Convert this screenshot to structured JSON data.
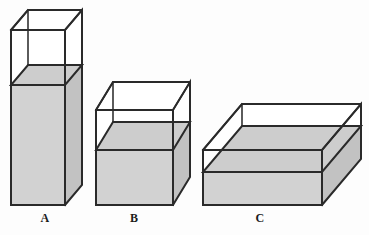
{
  "figure": {
    "background_color": "#fdfdfd",
    "edge_color": "#2a2a2a",
    "fill_front_color": "#d2d2d2",
    "fill_side_color": "#c2c2c2",
    "fill_top_color": "#cdcdcd",
    "empty_color": "#ffffff"
  },
  "shapes": [
    {
      "id": "A",
      "label": "A",
      "label_x": 45,
      "label_y": 222,
      "description": "tall narrow upright box, filled to about two thirds",
      "front_left": 11,
      "front_right": 65,
      "top_y": 30,
      "bottom_y": 205,
      "liquid_y": 85,
      "depth_dx": 17,
      "depth_dy": -20
    },
    {
      "id": "B",
      "label": "B",
      "label_x": 134,
      "label_y": 222,
      "description": "medium cube-like box, filled to about half",
      "front_left": 96,
      "front_right": 173,
      "top_y": 110,
      "bottom_y": 205,
      "liquid_y": 150,
      "depth_dx": 17,
      "depth_dy": -28
    },
    {
      "id": "C",
      "label": "C",
      "label_x": 260,
      "label_y": 222,
      "description": "wide flat box, filled to about two thirds",
      "front_left": 203,
      "front_right": 322,
      "top_y": 150,
      "bottom_y": 205,
      "liquid_y": 172,
      "depth_dx": 39,
      "depth_dy": -46
    }
  ]
}
